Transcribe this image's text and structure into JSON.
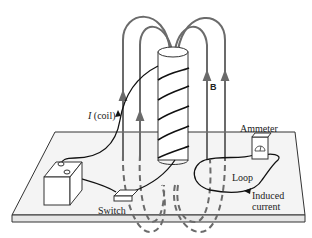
{
  "figure": {
    "labels": {
      "coil_symbol": "I",
      "coil_text": "(coil)",
      "field": "B",
      "ammeter": "Ammeter",
      "loop": "Loop",
      "induced_line1": "Induced",
      "induced_line2": "current",
      "switch": "Switch"
    },
    "colors": {
      "field_lines": "#6b6b6b",
      "wire": "#1a1a1a",
      "board_fill": "#f4f4f4",
      "board_edge": "#333333"
    }
  }
}
